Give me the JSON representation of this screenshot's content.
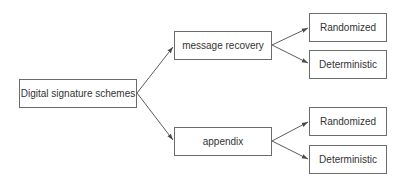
{
  "diagram": {
    "type": "tree",
    "root": {
      "label": "Digital signature schemes"
    },
    "branches": [
      {
        "label": "message recovery",
        "children": [
          {
            "label": "Randomized"
          },
          {
            "label": "Deterministic"
          }
        ]
      },
      {
        "label": "appendix",
        "children": [
          {
            "label": "Randomized"
          },
          {
            "label": "Deterministic"
          }
        ]
      }
    ],
    "colors": {
      "border": "#6b6b6b",
      "arrow": "#4a4a4a",
      "text": "#333333",
      "background": "#ffffff"
    }
  }
}
